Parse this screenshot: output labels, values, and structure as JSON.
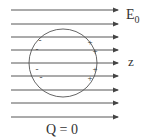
{
  "diagram": {
    "field_label": "E",
    "field_subscript": "0",
    "axis_label": "z",
    "charge_label": "Q = 0",
    "field_lines_count": 9,
    "field_line_y": [
      10,
      24,
      37,
      50,
      63,
      76,
      90,
      103,
      117
    ],
    "sphere": {
      "cx": 63,
      "cy": 63,
      "r": 34
    },
    "negative_charges": [
      {
        "x": 40,
        "y": 43,
        "label": "-"
      },
      {
        "x": 37,
        "y": 52,
        "label": "-"
      },
      {
        "x": 37,
        "y": 72,
        "label": "-"
      },
      {
        "x": 41,
        "y": 80,
        "label": "-"
      }
    ],
    "positive_charges": [
      {
        "x": 90,
        "y": 45,
        "label": "+"
      },
      {
        "x": 95,
        "y": 54,
        "label": "+"
      },
      {
        "x": 95,
        "y": 72,
        "label": "+"
      },
      {
        "x": 90,
        "y": 81,
        "label": "+"
      }
    ],
    "line_color": "#444444"
  }
}
